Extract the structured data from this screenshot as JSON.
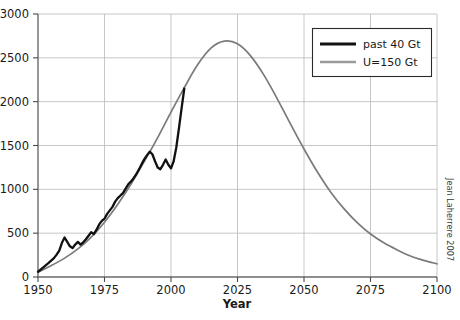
{
  "chart_data": {
    "type": "line",
    "title": "",
    "subtitle": "",
    "xlabel": "Year",
    "ylabel": "",
    "xlim": [
      1950,
      2100
    ],
    "ylim": [
      0,
      3000
    ],
    "xticks": [
      1950,
      1975,
      2000,
      2025,
      2050,
      2075,
      2100
    ],
    "xticklabels": [
      "1950",
      "1975",
      "2000",
      "2025",
      "2050",
      "2075",
      "2100"
    ],
    "yticks": [
      0,
      500,
      1000,
      1500,
      2000,
      2500,
      3000
    ],
    "yticklabels": [
      "0",
      "500",
      "1000",
      "1500",
      "2000",
      "2500",
      "3000"
    ],
    "grid": true,
    "grid_axis": "both",
    "legend_position": "top-right",
    "annotation": "Jean Laherrere 2007",
    "colors": {
      "past": "#111111",
      "model": "#7b7b7b",
      "grid": "#b9b9b9",
      "axis": "#6a6a6a",
      "text": "#1a1a1a",
      "background": "#ffffff"
    },
    "series": [
      {
        "name": "past 40 Gt",
        "color": "#111111",
        "x": [
          1950,
          1952,
          1954,
          1956,
          1957,
          1958,
          1959,
          1960,
          1961,
          1962,
          1963,
          1964,
          1965,
          1966,
          1967,
          1968,
          1969,
          1970,
          1971,
          1972,
          1973,
          1974,
          1975,
          1976,
          1977,
          1978,
          1979,
          1980,
          1981,
          1982,
          1983,
          1984,
          1985,
          1986,
          1987,
          1988,
          1989,
          1990,
          1991,
          1992,
          1993,
          1994,
          1995,
          1996,
          1997,
          1998,
          1999,
          2000,
          2001,
          2002,
          2003,
          2004,
          2005
        ],
        "y": [
          60,
          110,
          160,
          215,
          255,
          300,
          390,
          450,
          400,
          350,
          330,
          370,
          400,
          370,
          395,
          430,
          470,
          510,
          490,
          540,
          600,
          640,
          665,
          720,
          760,
          800,
          860,
          900,
          930,
          960,
          1010,
          1060,
          1090,
          1130,
          1175,
          1230,
          1290,
          1345,
          1390,
          1430,
          1400,
          1320,
          1250,
          1230,
          1280,
          1340,
          1280,
          1240,
          1320,
          1480,
          1700,
          1930,
          2150
        ]
      },
      {
        "name": "U=150 Gt",
        "color": "#7b7b7b",
        "x": [
          1950,
          1955,
          1960,
          1965,
          1970,
          1975,
          1980,
          1985,
          1990,
          1995,
          2000,
          2005,
          2010,
          2015,
          2020,
          2025,
          2030,
          2035,
          2040,
          2045,
          2050,
          2055,
          2060,
          2065,
          2070,
          2075,
          2080,
          2085,
          2090,
          2095,
          2100
        ],
        "y": [
          55,
          130,
          215,
          320,
          455,
          625,
          830,
          1060,
          1320,
          1590,
          1880,
          2160,
          2420,
          2610,
          2690,
          2660,
          2520,
          2300,
          2030,
          1740,
          1460,
          1200,
          970,
          780,
          620,
          490,
          390,
          310,
          240,
          190,
          150
        ]
      }
    ],
    "data_units": "Gt (cumulative resource scenario), production in Mb/d-equivalent index"
  },
  "legend": {
    "entries": [
      {
        "label": "past 40 Gt",
        "swatch": "black-line-swatch"
      },
      {
        "label": "U=150 Gt",
        "swatch": "gray-line-swatch"
      }
    ]
  },
  "axes": {
    "x_title": "Year",
    "y_title": ""
  },
  "credit": {
    "text": "Jean Laherrere 2007"
  }
}
